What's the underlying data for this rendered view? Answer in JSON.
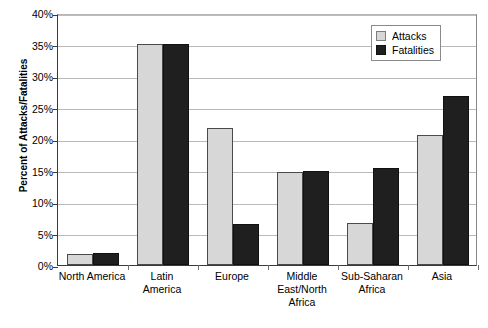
{
  "chart_data": {
    "type": "bar",
    "title": "",
    "subtitle": "",
    "xlabel": "",
    "ylabel": "Percent of Attacks/Fatalities",
    "ylim": [
      0,
      40
    ],
    "ytick_labels": [
      "0%",
      "5%",
      "10%",
      "15%",
      "20%",
      "25%",
      "30%",
      "35%",
      "40%"
    ],
    "ytick_values": [
      0,
      5,
      10,
      15,
      20,
      25,
      30,
      35,
      40
    ],
    "grid": true,
    "legend_position": "top-right",
    "categories": [
      "North America",
      "Latin America",
      "Europe",
      "Middle East/North Africa",
      "Sub-Saharan Africa",
      "Asia"
    ],
    "category_label_lines": [
      [
        "North America"
      ],
      [
        "Latin",
        "America"
      ],
      [
        "Europe"
      ],
      [
        "Middle",
        "East/North",
        "Africa"
      ],
      [
        "Sub-Saharan",
        "Africa"
      ],
      [
        "Asia"
      ]
    ],
    "series": [
      {
        "name": "Attacks",
        "color": "#d7d7d7",
        "values": [
          1.8,
          35.1,
          21.7,
          14.8,
          6.6,
          20.6
        ]
      },
      {
        "name": "Fatalities",
        "color": "#1f1f1f",
        "values": [
          1.9,
          35.1,
          6.5,
          15.0,
          15.4,
          26.8
        ]
      }
    ]
  },
  "legend": {
    "items": [
      {
        "label": "Attacks",
        "swatch": "attacks"
      },
      {
        "label": "Fatalities",
        "swatch": "fatalities"
      }
    ]
  }
}
